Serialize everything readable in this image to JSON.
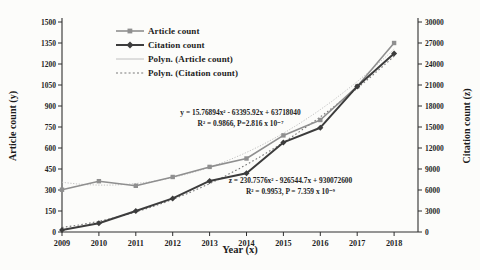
{
  "chart_data": {
    "type": "line",
    "title": "",
    "xlabel": "Year (x)",
    "ylabel_left": "Article count (y)",
    "ylabel_right": "Citation count (z)",
    "x": [
      2009,
      2010,
      2011,
      2012,
      2013,
      2014,
      2015,
      2016,
      2017,
      2018
    ],
    "left_axis": {
      "min": 0,
      "max": 1500,
      "step": 150
    },
    "right_axis": {
      "min": 0,
      "max": 30000,
      "step": 3000
    },
    "grid": false,
    "legend_position": "top-center-inside",
    "series": [
      {
        "name": "Article count",
        "axis": "left",
        "marker": "square",
        "line_style": "solid",
        "color": "#8f8f8f",
        "values": [
          302,
          363,
          330,
          393,
          465,
          525,
          690,
          800,
          1040,
          1350
        ]
      },
      {
        "name": "Citation count",
        "axis": "right",
        "marker": "diamond",
        "line_style": "solid",
        "color": "#3c3c3c",
        "values": [
          300,
          1250,
          3000,
          4800,
          7300,
          8400,
          12800,
          14900,
          20800,
          25500
        ]
      },
      {
        "name": "Polyn. (Article count)",
        "axis": "left",
        "marker": "none",
        "line_style": "fine-dotted",
        "color": "#b9b9b9",
        "trend": {
          "a": 15.76894,
          "b": -63395.92,
          "c": 63718040
        }
      },
      {
        "name": "Polyn. (Citation count)",
        "axis": "right",
        "marker": "none",
        "line_style": "dotted",
        "color": "#787878",
        "trend": {
          "a": 230.7576,
          "b": -926544.7,
          "c": 930072600
        }
      }
    ],
    "annotations": [
      {
        "line1": "y = 15.76894x² - 63395.92x + 63718040",
        "line2": "R² = 0.9866, P=2.816 x 10⁻⁷"
      },
      {
        "line1": "z = 230.7576x² - 926544.7x + 930072600",
        "line2": "R² = 0.9953, P = 7.359 x 10⁻⁹"
      }
    ],
    "axis_color": "#2e2e2e",
    "tick_label_color": "#1f1f1f"
  }
}
